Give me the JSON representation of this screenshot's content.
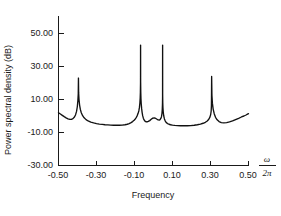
{
  "chart_data": {
    "type": "line",
    "title": "",
    "xlabel": "Frequency",
    "ylabel": "Power spectral density (dB)",
    "x_axis_unit_label": "ω / 2π",
    "x_axis_unit_numerator": "ω",
    "x_axis_unit_denominator": "2π",
    "xlim": [
      -0.5,
      0.5
    ],
    "ylim": [
      -30.0,
      60.0
    ],
    "xticks": [
      -0.5,
      -0.3,
      -0.1,
      0.1,
      0.3,
      0.5
    ],
    "xtick_labels": [
      "-0.50",
      "-0.30",
      "-0.10",
      "0.10",
      "0.30",
      "0.50"
    ],
    "yticks": [
      -30.0,
      -10.0,
      10.0,
      30.0,
      50.0
    ],
    "ytick_labels": [
      "-30.00",
      "-10.00",
      "10.00",
      "30.00",
      "50.00"
    ],
    "grid": false,
    "legend": false,
    "baseline_db": -5.0,
    "peaks": [
      {
        "frequency": -0.395,
        "peak_db": 23.0,
        "halfwidth": 0.011
      },
      {
        "frequency": -0.068,
        "peak_db": 43.0,
        "halfwidth": 0.0022
      },
      {
        "frequency": 0.048,
        "peak_db": 43.0,
        "halfwidth": 0.0022
      },
      {
        "frequency": 0.305,
        "peak_db": 24.0,
        "halfwidth": 0.011
      }
    ],
    "series": [
      {
        "name": "Power spectral density",
        "x": [
          -0.5,
          -0.49,
          -0.48,
          -0.47,
          -0.46,
          -0.45,
          -0.44,
          -0.432,
          -0.424,
          -0.416,
          -0.41,
          -0.405,
          -0.401,
          -0.398,
          -0.396,
          -0.395,
          -0.394,
          -0.392,
          -0.389,
          -0.385,
          -0.38,
          -0.373,
          -0.365,
          -0.355,
          -0.344,
          -0.33,
          -0.315,
          -0.3,
          -0.285,
          -0.27,
          -0.255,
          -0.24,
          -0.225,
          -0.21,
          -0.195,
          -0.18,
          -0.165,
          -0.15,
          -0.138,
          -0.128,
          -0.118,
          -0.11,
          -0.102,
          -0.096,
          -0.09,
          -0.085,
          -0.081,
          -0.077,
          -0.074,
          -0.0715,
          -0.07,
          -0.069,
          -0.0683,
          -0.068,
          -0.0677,
          -0.067,
          -0.066,
          -0.0645,
          -0.0625,
          -0.06,
          -0.057,
          -0.0535,
          -0.0495,
          -0.045,
          -0.04,
          -0.034,
          -0.0275,
          -0.02,
          -0.012,
          -0.004,
          0.004,
          0.012,
          0.019,
          0.025,
          0.03,
          0.0345,
          0.0385,
          0.042,
          0.0445,
          0.0462,
          0.0472,
          0.0478,
          0.048,
          0.0482,
          0.0488,
          0.0498,
          0.0515,
          0.054,
          0.0575,
          0.062,
          0.0675,
          0.074,
          0.0815,
          0.09,
          0.1,
          0.112,
          0.126,
          0.142,
          0.16,
          0.178,
          0.196,
          0.214,
          0.231,
          0.247,
          0.261,
          0.273,
          0.283,
          0.291,
          0.297,
          0.301,
          0.3035,
          0.3048,
          0.3052,
          0.306,
          0.3075,
          0.31,
          0.314,
          0.3195,
          0.3265,
          0.335,
          0.345,
          0.357,
          0.37,
          0.385,
          0.4,
          0.416,
          0.432,
          0.448,
          0.463,
          0.476,
          0.487,
          0.495,
          0.5
        ],
        "y": [
          2.0,
          1.2,
          0.4,
          -0.4,
          -1.1,
          -1.7,
          -2.0,
          -2.0,
          -1.6,
          -0.6,
          0.8,
          2.8,
          5.6,
          9.4,
          13.5,
          23.0,
          14.0,
          10.0,
          6.6,
          4.0,
          2.0,
          0.2,
          -1.1,
          -2.2,
          -3.0,
          -3.7,
          -4.2,
          -4.6,
          -4.9,
          -5.1,
          -5.3,
          -5.4,
          -5.5,
          -5.6,
          -5.6,
          -5.6,
          -5.5,
          -5.3,
          -5.0,
          -4.6,
          -4.0,
          -3.4,
          -2.6,
          -1.8,
          -0.8,
          0.4,
          1.6,
          3.2,
          5.2,
          8.0,
          11.0,
          14.5,
          20.0,
          43.0,
          20.5,
          14.5,
          10.5,
          7.2,
          4.6,
          2.2,
          0.2,
          -1.3,
          -2.4,
          -3.1,
          -3.5,
          -3.6,
          -3.3,
          -2.8,
          -2.0,
          -1.3,
          -1.2,
          -1.5,
          -2.0,
          -2.4,
          -2.5,
          -2.2,
          -1.5,
          -0.4,
          1.4,
          4.0,
          7.2,
          12.0,
          43.0,
          13.0,
          8.0,
          4.8,
          2.2,
          0.0,
          -1.8,
          -3.1,
          -4.0,
          -4.6,
          -5.0,
          -5.3,
          -5.5,
          -5.7,
          -5.8,
          -5.9,
          -5.9,
          -5.9,
          -5.8,
          -5.6,
          -5.3,
          -4.9,
          -4.4,
          -3.8,
          -3.0,
          -2.0,
          -0.7,
          0.9,
          3.0,
          6.0,
          10.5,
          24.0,
          12.5,
          7.8,
          4.2,
          1.4,
          -0.8,
          -2.3,
          -3.4,
          -4.0,
          -4.2,
          -4.0,
          -3.6,
          -3.0,
          -2.2,
          -1.4,
          -0.6,
          0.0,
          0.6,
          1.1,
          1.4
        ]
      }
    ]
  },
  "labels": {
    "y_axis_title": "Power spectral density (dB)",
    "x_axis_title": "Frequency"
  }
}
